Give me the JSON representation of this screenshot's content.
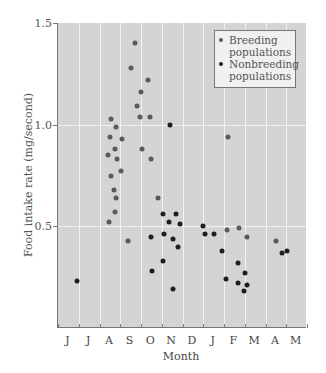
{
  "chart_data": {
    "type": "scatter",
    "title": "",
    "xlabel": "Month",
    "ylabel": "Food intake rate (mg/second)",
    "x_tick_labels": [
      "J",
      "J",
      "A",
      "S",
      "O",
      "N",
      "D",
      "J",
      "F",
      "M",
      "A",
      "M"
    ],
    "y_ticks": [
      0.5,
      1.0,
      1.5
    ],
    "ylim": [
      0.0,
      1.5
    ],
    "xlim": [
      0,
      12
    ],
    "grid": true,
    "legend_position": "upper right",
    "series": [
      {
        "name": "Breeding populations",
        "color": "#5a5a5a",
        "points": [
          [
            2.55,
            1.03
          ],
          [
            2.79,
            0.99
          ],
          [
            2.51,
            0.94
          ],
          [
            3.09,
            0.93
          ],
          [
            2.75,
            0.88
          ],
          [
            2.41,
            0.85
          ],
          [
            2.84,
            0.83
          ],
          [
            3.03,
            0.77
          ],
          [
            2.55,
            0.75
          ],
          [
            2.7,
            0.68
          ],
          [
            2.79,
            0.64
          ],
          [
            2.75,
            0.57
          ],
          [
            2.46,
            0.52
          ],
          [
            3.71,
            1.4
          ],
          [
            3.52,
            1.28
          ],
          [
            4.34,
            1.22
          ],
          [
            4.0,
            1.16
          ],
          [
            3.81,
            1.09
          ],
          [
            3.95,
            1.04
          ],
          [
            4.43,
            1.04
          ],
          [
            4.05,
            0.88
          ],
          [
            4.48,
            0.83
          ],
          [
            4.82,
            0.64
          ],
          [
            3.39,
            0.43
          ],
          [
            8.19,
            0.94
          ],
          [
            8.14,
            0.48
          ],
          [
            8.72,
            0.49
          ],
          [
            9.11,
            0.45
          ],
          [
            10.51,
            0.43
          ]
        ]
      },
      {
        "name": "Nonbreeding populations",
        "color": "#1e1e1e",
        "points": [
          [
            0.92,
            0.23
          ],
          [
            5.42,
            1.0
          ],
          [
            5.06,
            0.56
          ],
          [
            5.69,
            0.56
          ],
          [
            5.35,
            0.52
          ],
          [
            5.88,
            0.51
          ],
          [
            5.11,
            0.46
          ],
          [
            5.54,
            0.44
          ],
          [
            4.49,
            0.45
          ],
          [
            5.78,
            0.4
          ],
          [
            5.06,
            0.33
          ],
          [
            4.53,
            0.28
          ],
          [
            5.54,
            0.19
          ],
          [
            7.0,
            0.5
          ],
          [
            7.09,
            0.46
          ],
          [
            7.52,
            0.46
          ],
          [
            7.9,
            0.38
          ],
          [
            8.67,
            0.32
          ],
          [
            9.01,
            0.27
          ],
          [
            8.1,
            0.24
          ],
          [
            8.67,
            0.22
          ],
          [
            9.11,
            0.21
          ],
          [
            8.96,
            0.18
          ],
          [
            11.03,
            0.38
          ],
          [
            10.8,
            0.37
          ]
        ]
      }
    ]
  },
  "legend": {
    "breeding_label_1": "Breeding",
    "breeding_label_2": "populations",
    "nonbreeding_label_1": "Nonbreeding",
    "nonbreeding_label_2": "populations"
  }
}
